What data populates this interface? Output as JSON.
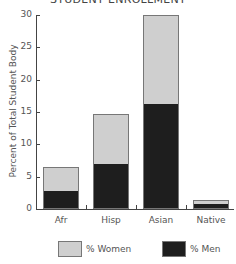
{
  "chart_data": {
    "type": "bar",
    "stacked": true,
    "title": "STUDENT ENROLLMENT",
    "xlabel": "",
    "ylabel": "Percent of Total Student Body",
    "ylim": [
      0,
      30
    ],
    "yticks": [
      0,
      5,
      10,
      15,
      20,
      25,
      30
    ],
    "grid": false,
    "legend_position": "bottom",
    "categories": [
      "Afr",
      "Hisp",
      "Asian",
      "Native"
    ],
    "series": [
      {
        "name": "% Men",
        "color": "#1e1e1e",
        "values": [
          2.6,
          6.8,
          16.1,
          0.6
        ]
      },
      {
        "name": "% Women",
        "color": "#cfcfcf",
        "values": [
          3.9,
          7.9,
          13.9,
          0.8
        ]
      }
    ],
    "totals": [
      6.5,
      14.7,
      30.0,
      1.4
    ]
  },
  "legend": {
    "women_label": "% Women",
    "men_label": "% Men"
  },
  "colors": {
    "women": "#cfcfcf",
    "men": "#1e1e1e",
    "axis": "#444444"
  }
}
